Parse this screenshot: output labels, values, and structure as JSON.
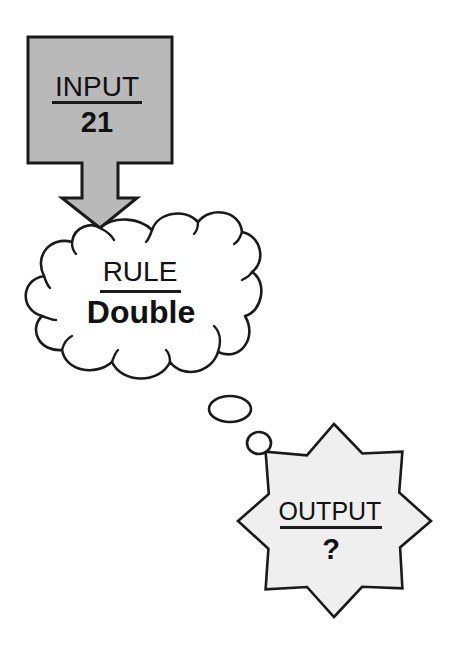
{
  "diagram": {
    "type": "function-machine",
    "colors": {
      "input_fill": "#b9b9b9",
      "cloud_fill": "#ffffff",
      "output_fill": "#efefef",
      "stroke": "#1a1a1a",
      "text": "#111111"
    },
    "input": {
      "heading": "INPUT",
      "value": "21",
      "shape": "box-with-down-arrow"
    },
    "rule": {
      "heading": "RULE",
      "value": "Double",
      "shape": "cloud"
    },
    "thought_bubbles": {
      "count": 2,
      "shape": "ellipse"
    },
    "output": {
      "heading": "OUTPUT",
      "value": "?",
      "shape": "starburst"
    }
  }
}
